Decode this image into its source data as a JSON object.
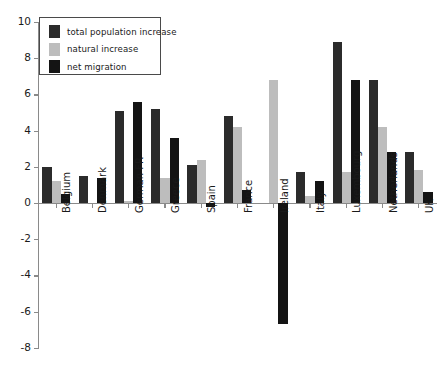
{
  "chart_data": {
    "type": "bar",
    "title": "",
    "subtitle": "",
    "xlabel": "",
    "ylabel": "",
    "ylim": [
      -8,
      10
    ],
    "ytick_values": [
      10,
      8,
      6,
      4,
      2,
      0,
      -2,
      -4,
      -6,
      -8
    ],
    "ytick_labels": [
      "10",
      "8",
      "6",
      "4",
      "2",
      "0",
      "-2",
      "-4",
      "-6",
      "-8"
    ],
    "grid": false,
    "legend_position": "top-left",
    "categories": [
      "Belgium",
      "Denmark",
      "German FR",
      "Greece",
      "Spain",
      "France",
      "Ireland",
      "Italy",
      "Luxembourg",
      "Netherlands",
      "UK"
    ],
    "series": [
      {
        "name": "total population increase",
        "color": "#2b2b2b",
        "values": [
          2.0,
          1.5,
          5.1,
          5.2,
          2.1,
          4.8,
          0.0,
          1.7,
          8.9,
          6.8,
          2.8
        ]
      },
      {
        "name": "natural increase",
        "color": "#bdbdbd",
        "values": [
          1.2,
          0.0,
          0.1,
          1.4,
          2.4,
          4.2,
          6.8,
          0.4,
          1.7,
          4.2,
          1.8
        ]
      },
      {
        "name": "net migration",
        "color": "#141414",
        "values": [
          0.5,
          1.4,
          5.6,
          3.6,
          -0.2,
          0.7,
          -6.7,
          1.2,
          6.8,
          2.8,
          0.6
        ]
      }
    ]
  },
  "legend": {
    "items": [
      {
        "label": "total population increase",
        "color": "#2b2b2b"
      },
      {
        "label": "natural increase",
        "color": "#bdbdbd"
      },
      {
        "label": "net migration",
        "color": "#141414"
      }
    ]
  },
  "axis": {
    "axis_color": "#8a8a8a",
    "zero_line_color": "#8a8a8a",
    "tick_color": "#8a8a8a"
  }
}
